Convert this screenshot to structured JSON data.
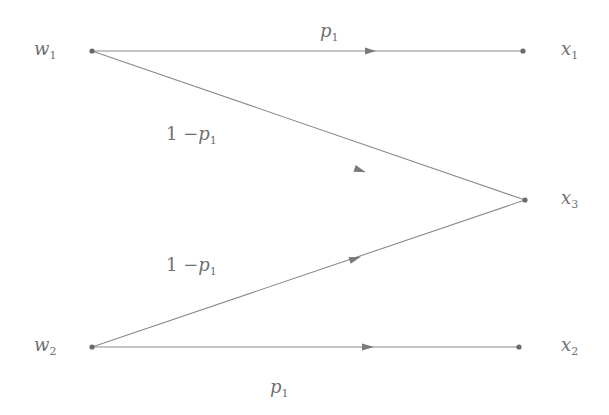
{
  "diagram": {
    "type": "channel transition diagram",
    "colors": {
      "line": "#8a8a8a",
      "node": "#6a6a6a",
      "text": "#707070"
    },
    "inputs": [
      {
        "id": "w1",
        "base": "w",
        "sub": "1"
      },
      {
        "id": "w2",
        "base": "w",
        "sub": "2"
      }
    ],
    "outputs": [
      {
        "id": "x1",
        "base": "x",
        "sub": "1"
      },
      {
        "id": "x3",
        "base": "x",
        "sub": "3"
      },
      {
        "id": "x2",
        "base": "x",
        "sub": "2"
      }
    ],
    "edges": [
      {
        "from": "w1",
        "to": "x1",
        "label": {
          "prefix": "",
          "base": "p",
          "sub": "1"
        }
      },
      {
        "from": "w1",
        "to": "x3",
        "label": {
          "prefix": "1 −",
          "base": "p",
          "sub": "1"
        }
      },
      {
        "from": "w2",
        "to": "x3",
        "label": {
          "prefix": "1 −",
          "base": "p",
          "sub": "1"
        }
      },
      {
        "from": "w2",
        "to": "x2",
        "label": {
          "prefix": "",
          "base": "p",
          "sub": "1"
        }
      }
    ]
  }
}
